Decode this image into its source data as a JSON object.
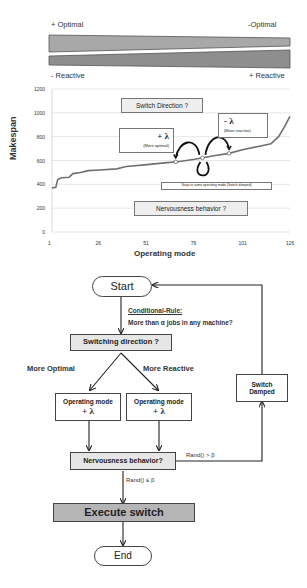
{
  "top_bars": {
    "left_top": "+ Optimal",
    "right_top": "-Optimal",
    "left_bottom": "- Reactive",
    "right_bottom": "+ Reactive"
  },
  "chart_data": {
    "type": "line",
    "title": "",
    "xlabel": "Operating mode",
    "ylabel": "Makespan",
    "xlim": [
      1,
      126
    ],
    "ylim": [
      0,
      1200
    ],
    "x_ticks": [
      "1",
      "26",
      "51",
      "76",
      "101",
      "126"
    ],
    "y_ticks": [
      "0",
      "200",
      "400",
      "600",
      "800",
      "1000",
      "1200"
    ],
    "grid": true,
    "series": [
      {
        "name": "Makespan",
        "x": [
          1,
          3,
          4,
          6,
          10,
          12,
          16,
          20,
          26,
          35,
          40,
          51,
          60,
          67,
          76,
          86,
          94,
          101,
          110,
          116,
          120,
          123,
          125,
          126
        ],
        "y": [
          370,
          375,
          440,
          455,
          460,
          490,
          500,
          515,
          520,
          530,
          550,
          565,
          580,
          590,
          610,
          640,
          660,
          690,
          720,
          740,
          800,
          880,
          940,
          970
        ]
      }
    ],
    "annotations": {
      "switch_direction": "Switch Direction ?",
      "plus_lambda": "+ λ",
      "plus_lambda_sub": "(More optimal)",
      "minus_lambda": "- λ",
      "minus_lambda_sub": "(More reactive)",
      "stays": "Stays in same operating mode (Switch damped)",
      "nervousness": "Nervousness behavior ?"
    }
  },
  "flowchart": {
    "start": "Start",
    "rule_title": "Conditional-Rule:",
    "rule_text": "More than α jobs in any machine?",
    "switching": "Switching direction ?",
    "more_optimal": "More Optimal",
    "more_reactive": "More Reactive",
    "op_mode_left_line1": "Operating mode",
    "op_mode_left_line2": "+ λ",
    "op_mode_right_line1": "Operating mode",
    "op_mode_right_line2": "+ λ",
    "switch_damped_line1": "Switch",
    "switch_damped_line2": "Damped",
    "nervousness": "Nervousness behavior?",
    "rand_gt": "Rand() > β",
    "rand_le": "Rand() ≤ β",
    "execute": "Execute switch",
    "end": "End"
  }
}
